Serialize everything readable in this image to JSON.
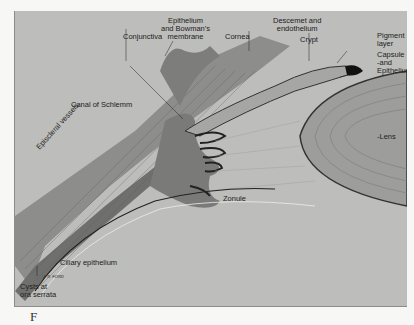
{
  "figure": {
    "background_color": "#bdbdbb",
    "page_color": "#f7f7f5",
    "labels": {
      "conjunctiva": "Conjunctiva",
      "epithelium_bowman": "Epithelium\nand Bowman's\nmembrane",
      "cornea": "Cornea",
      "descemet": "Descemet and\nendothelium",
      "crypt": "Crypt",
      "pigment_layer": "Pigment\nlayer",
      "capsule_epithelium": "Capsule\n-and\nEpithelium",
      "canal_schlemm": "Canal of Schlemm",
      "episcleral_vessels": "Episcleral vessels",
      "lens": "-Lens",
      "zonule": "Zonule",
      "ciliary_epithelium": "Ciliary epithelium",
      "cysts_ora_serrata": "Cysts at\nora serrata",
      "artist_signature": "J. R. FORD"
    },
    "caption_fragment": "F"
  }
}
